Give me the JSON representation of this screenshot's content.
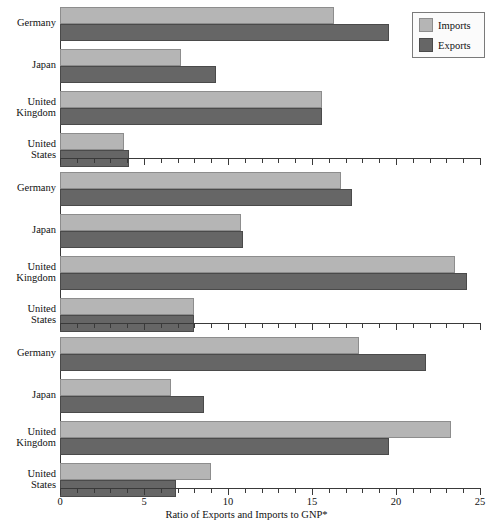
{
  "chart_data": {
    "type": "bar",
    "orientation": "horizontal",
    "title": "",
    "xlabel": "Ratio of Exports and Imports to GNP*",
    "ylabel": "",
    "xlim": [
      0,
      25
    ],
    "xticks": [
      0,
      5,
      10,
      15,
      20,
      25
    ],
    "xtick_labels": [
      "0",
      "5",
      "10",
      "15",
      "20",
      "25"
    ],
    "minor_tick_interval": 1,
    "grid": false,
    "legend": {
      "position": "top-right",
      "entries": [
        {
          "name": "Imports",
          "color": "#b5b5b5"
        },
        {
          "name": "Exports",
          "color": "#666666"
        }
      ]
    },
    "categories": [
      "Germany",
      "Japan",
      "United Kingdom",
      "United States"
    ],
    "panels": [
      {
        "label": "1970",
        "series": [
          {
            "name": "Imports",
            "values": [
              16.3,
              7.2,
              15.6,
              3.8
            ]
          },
          {
            "name": "Exports",
            "values": [
              19.6,
              9.3,
              15.6,
              4.1
            ]
          }
        ]
      },
      {
        "label": "1980",
        "series": [
          {
            "name": "Imports",
            "values": [
              16.7,
              10.8,
              23.5,
              8.0
            ]
          },
          {
            "name": "Exports",
            "values": [
              17.4,
              10.9,
              24.2,
              8.0
            ]
          }
        ]
      },
      {
        "label": "1990",
        "series": [
          {
            "name": "Imports",
            "values": [
              17.8,
              6.6,
              23.3,
              9.0
            ]
          },
          {
            "name": "Exports",
            "values": [
              21.8,
              8.6,
              19.6,
              6.9
            ]
          }
        ]
      }
    ]
  },
  "labels": {
    "country_lines": [
      [
        "Germany"
      ],
      [
        "Japan"
      ],
      [
        "United",
        "Kingdom"
      ],
      [
        "United",
        "States"
      ]
    ]
  }
}
